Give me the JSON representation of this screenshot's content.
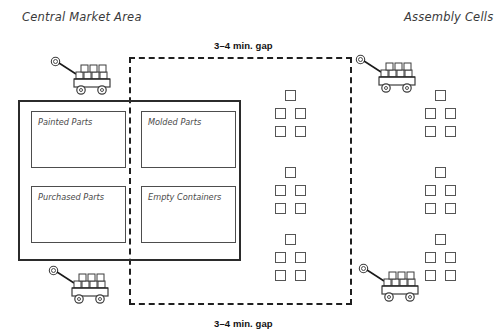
{
  "diagram": {
    "title_left": "Central Market Area",
    "title_right": "Assembly Cells",
    "gap_label_top": "3–4 min. gap",
    "gap_label_bottom": "3–4 min. gap",
    "colors": {
      "background": "#ffffff",
      "outline_dark": "#2b2b2b",
      "outline_medium": "#4d4d4d",
      "outline_light": "#555555",
      "text_italic": "#3a3a3a",
      "text_bold": "#111111",
      "dashed_route": "#1f1f1f"
    }
  },
  "market_area": {
    "name": "central-market-area",
    "outer": {
      "x": 18,
      "y": 100,
      "w": 223,
      "h": 161
    },
    "bins": [
      {
        "label": "Painted Parts",
        "x": 31,
        "y": 111,
        "w": 95,
        "h": 57
      },
      {
        "label": "Molded Parts",
        "x": 141,
        "y": 111,
        "w": 95,
        "h": 57
      },
      {
        "label": "Purchased Parts",
        "x": 31,
        "y": 186,
        "w": 95,
        "h": 57
      },
      {
        "label": "Empty Containers",
        "x": 141,
        "y": 186,
        "w": 95,
        "h": 57
      }
    ]
  },
  "route": {
    "name": "tugger-route-dashed-loop",
    "x": 129,
    "y": 57,
    "w": 223,
    "h": 248
  },
  "assembly_cells": {
    "square_size": 11,
    "clusters": [
      {
        "name": "assembly-cell-1",
        "x": 275,
        "y": 90
      },
      {
        "name": "assembly-cell-2",
        "x": 425,
        "y": 90
      },
      {
        "name": "assembly-cell-3",
        "x": 275,
        "y": 167
      },
      {
        "name": "assembly-cell-4",
        "x": 425,
        "y": 167
      },
      {
        "name": "assembly-cell-5",
        "x": 275,
        "y": 234
      },
      {
        "name": "assembly-cell-6",
        "x": 425,
        "y": 234
      }
    ]
  },
  "carts": [
    {
      "name": "tugger-cart-top-left",
      "x": 50,
      "y": 55
    },
    {
      "name": "tugger-cart-top-right",
      "x": 355,
      "y": 53
    },
    {
      "name": "tugger-cart-bottom-left",
      "x": 48,
      "y": 264
    },
    {
      "name": "tugger-cart-bottom-right",
      "x": 358,
      "y": 262
    }
  ],
  "labels": {
    "title_left_pos": {
      "x": 22,
      "y": 10
    },
    "title_right_pos": {
      "x": 404,
      "y": 10
    },
    "gap_top_pos": {
      "x": 214,
      "y": 40
    },
    "gap_bottom_pos": {
      "x": 214,
      "y": 318
    }
  }
}
